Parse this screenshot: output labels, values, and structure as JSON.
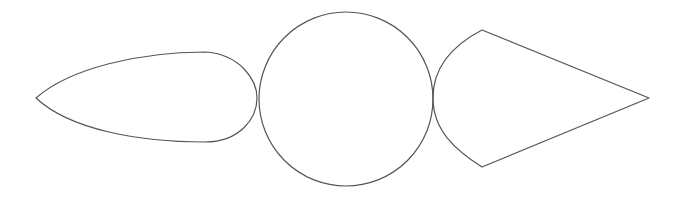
{
  "canvas": {
    "width": 685,
    "height": 199,
    "background": "#ffffff"
  },
  "stroke_color": "#555555",
  "shapes": [
    {
      "id": "teardrop",
      "type": "path",
      "description": "Elongated teardrop/lens shape pointing left",
      "d": "M 36 98 C 70 68, 140 52, 205 52 C 240 54, 257 80, 257 98 C 257 118, 240 142, 205 142 C 140 142, 70 130, 36 98 Z"
    },
    {
      "id": "circle",
      "type": "circle",
      "description": "Large circle in the center",
      "cx": 346,
      "cy": 99,
      "r": 87
    },
    {
      "id": "kite",
      "type": "path",
      "description": "Kite / cone shape with curved left side pointing right",
      "d": "M 482 30 L 649 98 L 482 167 C 455 150, 433 130, 433 98 C 433 66, 455 44, 482 30 Z"
    }
  ]
}
